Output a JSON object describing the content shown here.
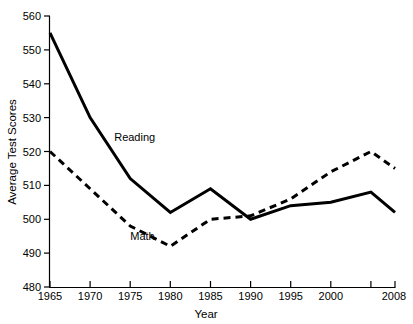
{
  "chart_data": {
    "type": "line",
    "title": "",
    "subtitle": "",
    "xlabel": "Year",
    "ylabel": "Average Test Scores",
    "xlim": [
      1965,
      2008
    ],
    "ylim": [
      480,
      560
    ],
    "grid": false,
    "legend_position": "inline-annotation",
    "x": [
      1965,
      1970,
      1975,
      1980,
      1985,
      1990,
      1995,
      2000,
      2005,
      2008
    ],
    "xtick_labels": [
      "1965",
      "1970",
      "1975",
      "1980",
      "1985",
      "1990",
      "1995",
      "2000",
      "",
      "2008"
    ],
    "ytick_labels": [
      "480",
      "490",
      "500",
      "510",
      "520",
      "530",
      "540",
      "550",
      "560"
    ],
    "ytick_values": [
      480,
      490,
      500,
      510,
      520,
      530,
      540,
      550,
      560
    ],
    "series": [
      {
        "name": "Reading",
        "style": "solid",
        "color": "#000000",
        "values": [
          555,
          530,
          512,
          502,
          509,
          500,
          504,
          505,
          508,
          502
        ]
      },
      {
        "name": "Math",
        "style": "dashed",
        "color": "#000000",
        "values": [
          520,
          509,
          498,
          492,
          500,
          501,
          506,
          514,
          520,
          515
        ]
      }
    ],
    "annotations": [
      {
        "text": "Reading",
        "x": 1973,
        "y": 523
      },
      {
        "text": "Math",
        "x": 1975,
        "y": 494
      }
    ]
  },
  "axis": {
    "x_title": "Year",
    "y_title": "Average Test Scores"
  },
  "series_labels": {
    "reading": "Reading",
    "math": "Math"
  },
  "ticks": {
    "y": [
      "560",
      "550",
      "540",
      "530",
      "520",
      "510",
      "500",
      "490",
      "480"
    ],
    "x": [
      "1965",
      "1970",
      "1975",
      "1980",
      "1985",
      "1990",
      "1995",
      "2000",
      "2008"
    ]
  }
}
